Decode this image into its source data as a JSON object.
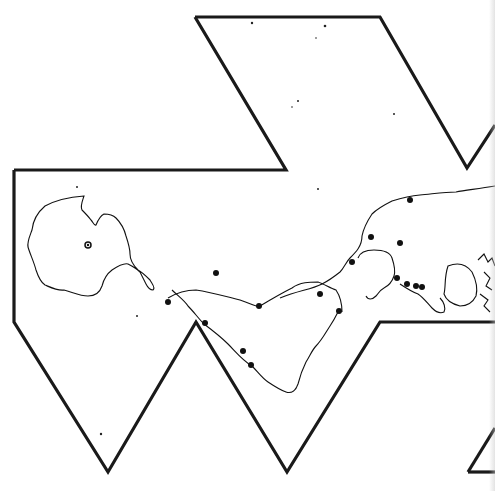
{
  "map": {
    "projection": "icosahedral (Dymaxion-style) unfolded net",
    "colors": {
      "background": "#ffffff",
      "outline": "#1a1a1a",
      "coast": "#111111",
      "marker": "#111111"
    },
    "net_outline": [
      [
        [
          195,
          17
        ],
        [
          380,
          17
        ],
        [
          467,
          168
        ],
        [
          495,
          125
        ]
      ],
      [
        [
          14,
          170
        ],
        [
          286,
          170
        ],
        [
          195,
          17
        ]
      ],
      [
        [
          14,
          170
        ],
        [
          14,
          322
        ],
        [
          108,
          472
        ],
        [
          196,
          322
        ],
        [
          287,
          472
        ],
        [
          380,
          322
        ],
        [
          495,
          322
        ]
      ],
      [
        [
          468,
          472
        ],
        [
          495,
          428
        ]
      ],
      [
        [
          468,
          472
        ],
        [
          495,
          472
        ]
      ]
    ],
    "markers": [
      {
        "x": 88,
        "y": 245,
        "style": "ring"
      },
      {
        "x": 205,
        "y": 323
      },
      {
        "x": 243,
        "y": 351
      },
      {
        "x": 251,
        "y": 365
      },
      {
        "x": 259,
        "y": 306
      },
      {
        "x": 320,
        "y": 294
      },
      {
        "x": 339,
        "y": 311
      },
      {
        "x": 352,
        "y": 262
      },
      {
        "x": 371,
        "y": 237
      },
      {
        "x": 400,
        "y": 243
      },
      {
        "x": 410,
        "y": 200
      },
      {
        "x": 397,
        "y": 278
      },
      {
        "x": 407,
        "y": 284
      },
      {
        "x": 416,
        "y": 286
      },
      {
        "x": 422,
        "y": 287
      },
      {
        "x": 216,
        "y": 273
      },
      {
        "x": 168,
        "y": 302
      }
    ]
  }
}
